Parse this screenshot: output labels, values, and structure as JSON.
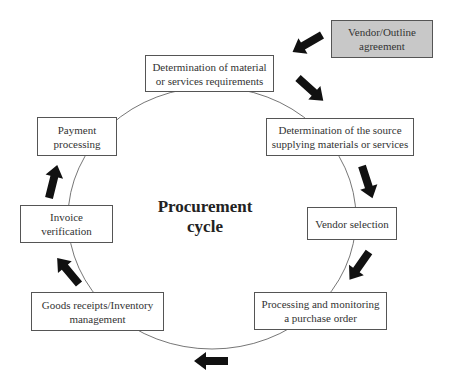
{
  "diagram": {
    "title": "Procurement cycle",
    "title_line1": "Procurement",
    "title_line2": "cycle",
    "external_input": {
      "line1": "Vendor/Outline",
      "line2": "agreement",
      "fill": "#c8c8c8"
    },
    "steps": [
      {
        "line1": "Determination of material",
        "line2": "or services requirements"
      },
      {
        "line1": "Determination of the source",
        "line2": "supplying materials or services"
      },
      {
        "line1": "Vendor selection",
        "line2": ""
      },
      {
        "line1": "Processing and monitoring",
        "line2": "a purchase order"
      },
      {
        "line1": "Goods receipts/Inventory",
        "line2": "management"
      },
      {
        "line1": "Invoice",
        "line2": "verification"
      },
      {
        "line1": "Payment",
        "line2": "processing"
      }
    ],
    "arrow_color": "#111111",
    "cycle_direction": "clockwise"
  }
}
